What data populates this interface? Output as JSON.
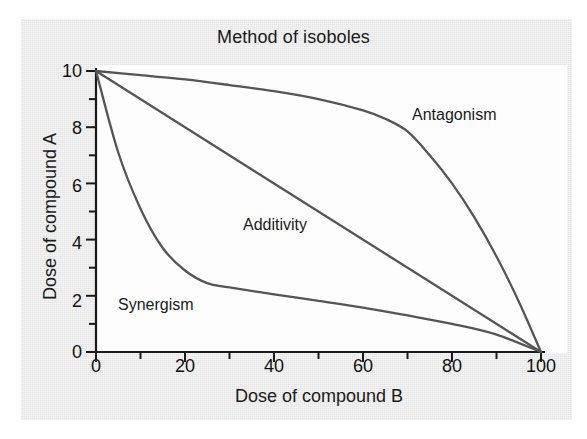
{
  "figure": {
    "title": "Method of isoboles",
    "background_color": "#ebebeb",
    "plot_background_color": "#fdfdfd",
    "line_color": "#555555",
    "axis_color": "#1a1a1a"
  },
  "axes": {
    "xlabel": "Dose of compound B",
    "ylabel": "Dose of compound A",
    "x_ticks": [
      "0",
      "20",
      "40",
      "60",
      "80",
      "100"
    ],
    "y_ticks": [
      "0",
      "2",
      "4",
      "6",
      "8",
      "10"
    ]
  },
  "labels": {
    "antagonism": "Antagonism",
    "additivity": "Additivity",
    "synergism": "Synergism"
  },
  "chart_data": {
    "type": "line",
    "title": "Method of isoboles",
    "xlabel": "Dose of compound B",
    "ylabel": "Dose of compound A",
    "xlim": [
      0,
      100
    ],
    "ylim": [
      0,
      10
    ],
    "x_ticks": [
      0,
      20,
      40,
      60,
      80,
      100
    ],
    "y_ticks": [
      0,
      2,
      4,
      6,
      8,
      10
    ],
    "x_minor_ticks": [
      10,
      30,
      50,
      70,
      90
    ],
    "y_minor_ticks": [
      1,
      3,
      5,
      7,
      9
    ],
    "grid": false,
    "legend": "none (curves labeled inline)",
    "annotations": [
      {
        "text": "Antagonism",
        "x": 71,
        "y": 8.6
      },
      {
        "text": "Additivity",
        "x": 33,
        "y": 4.3
      },
      {
        "text": "Synergism",
        "x": 5,
        "y": 1.8
      }
    ],
    "series": [
      {
        "name": "Antagonism",
        "color": "#555555",
        "x": [
          0,
          10,
          20,
          30,
          40,
          50,
          60,
          65,
          70,
          75,
          80,
          85,
          90,
          95,
          100
        ],
        "y": [
          10.0,
          9.85,
          9.7,
          9.5,
          9.28,
          9.0,
          8.6,
          8.3,
          7.85,
          7.0,
          6.0,
          4.8,
          3.4,
          1.8,
          0.0
        ]
      },
      {
        "name": "Additivity",
        "color": "#555555",
        "x": [
          0,
          20,
          40,
          60,
          80,
          100
        ],
        "y": [
          10.0,
          8.0,
          6.0,
          4.0,
          2.0,
          0.0
        ]
      },
      {
        "name": "Synergism",
        "color": "#555555",
        "x": [
          0,
          5,
          10,
          15,
          20,
          25,
          30,
          40,
          50,
          60,
          70,
          80,
          90,
          100
        ],
        "y": [
          10.0,
          7.1,
          5.1,
          3.7,
          2.9,
          2.45,
          2.3,
          2.05,
          1.82,
          1.58,
          1.3,
          1.0,
          0.62,
          0.0
        ]
      }
    ]
  }
}
